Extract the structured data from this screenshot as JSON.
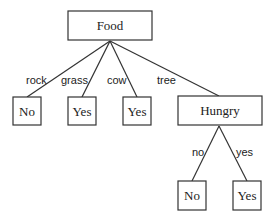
{
  "diagram": {
    "type": "decision-tree",
    "nodes": [
      {
        "id": "food",
        "label": "Food",
        "x": 68,
        "y": 11,
        "w": 84,
        "h": 29
      },
      {
        "id": "leaf-rock",
        "label": "No",
        "x": 13,
        "y": 97,
        "w": 28,
        "h": 28
      },
      {
        "id": "leaf-grass",
        "label": "Yes",
        "x": 68,
        "y": 97,
        "w": 28,
        "h": 28
      },
      {
        "id": "leaf-cow",
        "label": "Yes",
        "x": 123,
        "y": 97,
        "w": 28,
        "h": 28
      },
      {
        "id": "hungry",
        "label": "Hungry",
        "x": 178,
        "y": 96,
        "w": 84,
        "h": 29
      },
      {
        "id": "leaf-no",
        "label": "No",
        "x": 178,
        "y": 181,
        "w": 28,
        "h": 29
      },
      {
        "id": "leaf-yes",
        "label": "Yes",
        "x": 233,
        "y": 181,
        "w": 28,
        "h": 29
      }
    ],
    "edges": [
      {
        "from": "food",
        "to": "leaf-rock",
        "label": "rock",
        "x1": 110,
        "y1": 41,
        "x2": 27,
        "y2": 97,
        "lx": 26,
        "ly": 84
      },
      {
        "from": "food",
        "to": "leaf-grass",
        "label": "grass",
        "x1": 110,
        "y1": 41,
        "x2": 82,
        "y2": 97,
        "lx": 61,
        "ly": 84
      },
      {
        "from": "food",
        "to": "leaf-cow",
        "label": "cow",
        "x1": 110,
        "y1": 41,
        "x2": 137,
        "y2": 97,
        "lx": 107,
        "ly": 84
      },
      {
        "from": "food",
        "to": "hungry",
        "label": "tree",
        "x1": 110,
        "y1": 41,
        "x2": 219,
        "y2": 96,
        "lx": 157,
        "ly": 84
      },
      {
        "from": "hungry",
        "to": "leaf-no",
        "label": "no",
        "x1": 219,
        "y1": 126,
        "x2": 192,
        "y2": 181,
        "lx": 192,
        "ly": 156
      },
      {
        "from": "hungry",
        "to": "leaf-yes",
        "label": "yes",
        "x1": 219,
        "y1": 126,
        "x2": 247,
        "y2": 181,
        "lx": 236,
        "ly": 156
      }
    ]
  }
}
